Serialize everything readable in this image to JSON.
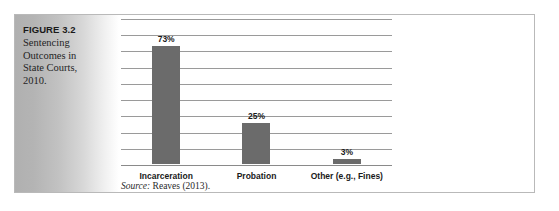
{
  "figure": {
    "number_label": "FIGURE 3.2",
    "caption": "Sentencing Outcomes in State Courts, 2010.",
    "source_word": "Source:",
    "source_text": " Reaves (2013)."
  },
  "colors": {
    "bar_fill": "#6b6b6b",
    "gridline": "#9a9a9a",
    "frame_border": "#b9b9b9",
    "panel_gradient_start": "#b0b0b0",
    "panel_gradient_end": "#ffffff",
    "text": "#1a1a1a"
  },
  "chart_data": {
    "type": "bar",
    "title": "Sentencing Outcomes in State Courts, 2010.",
    "xlabel": "",
    "ylabel": "",
    "categories": [
      "Incarceration",
      "Probation",
      "Other (e.g., Fines)"
    ],
    "values": [
      73,
      25,
      3
    ],
    "data_labels": [
      "73%",
      "25%",
      "3%"
    ],
    "unit": "percent",
    "ylim": [
      0,
      90
    ],
    "ytick_interval": 10,
    "yticks_visible": false,
    "gridlines": 9,
    "grid": true,
    "legend": false,
    "source": "Source: Reaves (2013)."
  }
}
